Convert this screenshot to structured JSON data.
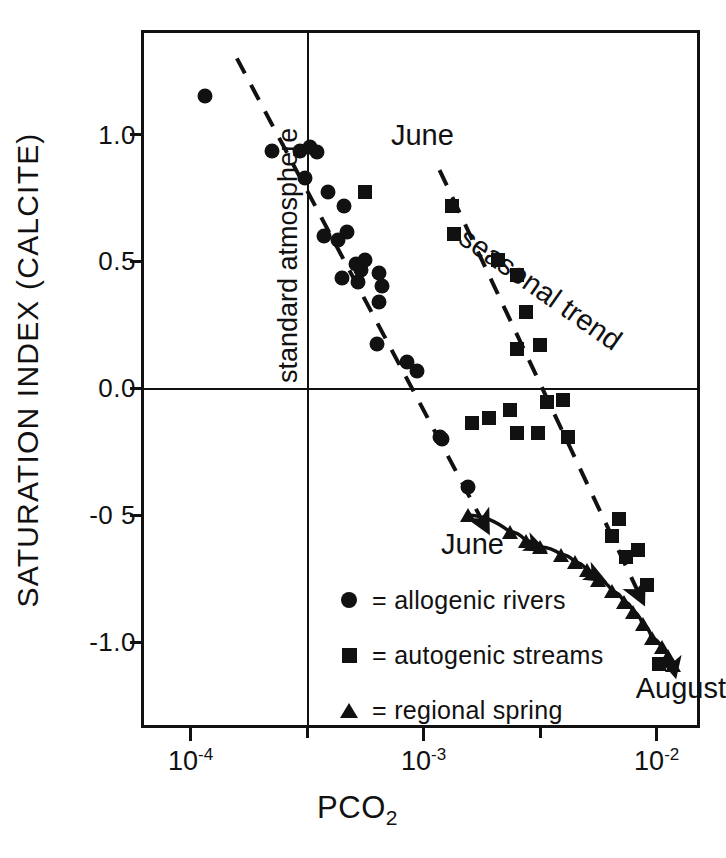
{
  "figure": {
    "background_color": "#ffffff",
    "ink_color": "#111111"
  },
  "axes": {
    "y_title": "SATURATION INDEX (CALCITE)",
    "x_title_main": "PCO",
    "x_title_sub": "2",
    "y_ticks": [
      {
        "value": 1.0,
        "label": "1.0"
      },
      {
        "value": 0.5,
        "label": "0.5"
      },
      {
        "value": 0.0,
        "label": "0.0"
      },
      {
        "value": -0.5,
        "label": "-0 5"
      },
      {
        "value": -1.0,
        "label": "-1.0"
      }
    ],
    "x_ticks": [
      {
        "value": 0.0001,
        "mantissa": "10",
        "exponent": "-4",
        "major": true
      },
      {
        "value": 0.000316,
        "mantissa": "",
        "exponent": "",
        "major": false
      },
      {
        "value": 0.001,
        "mantissa": "10",
        "exponent": "-3",
        "major": true
      },
      {
        "value": 0.00316,
        "mantissa": "",
        "exponent": "",
        "major": false
      },
      {
        "value": 0.01,
        "mantissa": "10",
        "exponent": "-2",
        "major": true
      }
    ]
  },
  "annotations": {
    "june_upper": "June",
    "seasonal_trend": "seasonal trend",
    "june_lower": "June",
    "august": "August",
    "standard_atmosphere": "standard  atmosphere"
  },
  "legend": {
    "items": [
      {
        "symbol": "circle",
        "label": "= allogenic  rivers"
      },
      {
        "symbol": "square",
        "label": "= autogenic  streams"
      },
      {
        "symbol": "triangle",
        "label": "= regional  spring"
      }
    ]
  },
  "chart_data": {
    "type": "scatter",
    "title": "",
    "xlabel": "PCO2",
    "ylabel": "SATURATION INDEX (CALCITE)",
    "x_scale": "log",
    "xlim": [
      6.31e-05,
      0.0158
    ],
    "ylim": [
      -1.35,
      1.4
    ],
    "grid": false,
    "legend_position": "inside-lower-left",
    "reference_lines": [
      {
        "name": "standard atmosphere",
        "orientation": "vertical",
        "x": 0.000316,
        "style": "solid",
        "label": "standard  atmosphere"
      },
      {
        "name": "zero saturation",
        "orientation": "horizontal",
        "y": 0.0,
        "style": "solid",
        "label": ""
      }
    ],
    "trend_lines": [
      {
        "name": "allogenic rivers seasonal trend",
        "style": "dashed",
        "arrow_end": true,
        "start": {
          "x": 0.000158,
          "y": 1.3
        },
        "end": {
          "x": 0.00178,
          "y": -0.52
        },
        "label": "June"
      },
      {
        "name": "autogenic streams seasonal trend",
        "style": "dashed",
        "arrow_end": true,
        "start": {
          "x": 0.00117,
          "y": 0.86
        },
        "end": {
          "x": 0.0083,
          "y": -0.8
        },
        "label": "seasonal trend"
      },
      {
        "name": "regional spring trend",
        "style": "solid",
        "arrow_end": true,
        "start": {
          "x": 0.00155,
          "y": -0.5
        },
        "end": {
          "x": 0.0104,
          "y": -1.05
        },
        "label": "June → August"
      }
    ],
    "series": [
      {
        "name": "allogenic rivers",
        "symbol": "circle",
        "points": [
          {
            "x": 0.000115,
            "y": 1.15
          },
          {
            "x": 0.000224,
            "y": 0.935
          },
          {
            "x": 0.000295,
            "y": 0.935
          },
          {
            "x": 0.000324,
            "y": 0.95
          },
          {
            "x": 0.000347,
            "y": 0.93
          },
          {
            "x": 0.000309,
            "y": 0.83
          },
          {
            "x": 0.000389,
            "y": 0.775
          },
          {
            "x": 0.000372,
            "y": 0.6
          },
          {
            "x": 0.000427,
            "y": 0.585
          },
          {
            "x": 0.000457,
            "y": 0.72
          },
          {
            "x": 0.000468,
            "y": 0.615
          },
          {
            "x": 0.000447,
            "y": 0.435
          },
          {
            "x": 0.000513,
            "y": 0.49
          },
          {
            "x": 0.000525,
            "y": 0.42
          },
          {
            "x": 0.000537,
            "y": 0.465
          },
          {
            "x": 0.000562,
            "y": 0.505
          },
          {
            "x": 0.000646,
            "y": 0.455
          },
          {
            "x": 0.000661,
            "y": 0.405
          },
          {
            "x": 0.000646,
            "y": 0.34
          },
          {
            "x": 0.000631,
            "y": 0.175
          },
          {
            "x": 0.000851,
            "y": 0.105
          },
          {
            "x": 0.000933,
            "y": 0.07
          },
          {
            "x": 0.00118,
            "y": -0.19
          },
          {
            "x": 0.0012,
            "y": -0.2
          },
          {
            "x": 0.00155,
            "y": -0.39
          }
        ]
      },
      {
        "name": "autogenic streams",
        "symbol": "square",
        "points": [
          {
            "x": 0.000562,
            "y": 0.775
          },
          {
            "x": 0.00132,
            "y": 0.72
          },
          {
            "x": 0.00135,
            "y": 0.61
          },
          {
            "x": 0.00209,
            "y": 0.505
          },
          {
            "x": 0.00251,
            "y": 0.445
          },
          {
            "x": 0.00275,
            "y": 0.3
          },
          {
            "x": 0.00251,
            "y": 0.155
          },
          {
            "x": 0.00316,
            "y": 0.17
          },
          {
            "x": 0.00162,
            "y": -0.135
          },
          {
            "x": 0.00191,
            "y": -0.115
          },
          {
            "x": 0.00234,
            "y": -0.085
          },
          {
            "x": 0.00251,
            "y": -0.175
          },
          {
            "x": 0.00309,
            "y": -0.175
          },
          {
            "x": 0.00339,
            "y": -0.055
          },
          {
            "x": 0.00398,
            "y": -0.045
          },
          {
            "x": 0.00417,
            "y": -0.19
          },
          {
            "x": 0.00646,
            "y": -0.58
          },
          {
            "x": 0.00692,
            "y": -0.515
          },
          {
            "x": 0.00741,
            "y": -0.665
          },
          {
            "x": 0.00832,
            "y": -0.635
          },
          {
            "x": 0.00912,
            "y": -0.775
          },
          {
            "x": 0.0102,
            "y": -1.085
          }
        ]
      },
      {
        "name": "regional spring",
        "symbol": "triangle",
        "points": [
          {
            "x": 0.00155,
            "y": -0.5
          },
          {
            "x": 0.00234,
            "y": -0.565
          },
          {
            "x": 0.00275,
            "y": -0.6
          },
          {
            "x": 0.00316,
            "y": -0.625
          },
          {
            "x": 0.00389,
            "y": -0.655
          },
          {
            "x": 0.00447,
            "y": -0.685
          },
          {
            "x": 0.00501,
            "y": -0.715
          },
          {
            "x": 0.00562,
            "y": -0.755
          },
          {
            "x": 0.00646,
            "y": -0.8
          },
          {
            "x": 0.00724,
            "y": -0.84
          },
          {
            "x": 0.00794,
            "y": -0.88
          },
          {
            "x": 0.00871,
            "y": -0.93
          },
          {
            "x": 0.00955,
            "y": -0.985
          },
          {
            "x": 0.0105,
            "y": -1.02
          },
          {
            "x": 0.0112,
            "y": -1.055
          },
          {
            "x": 0.0117,
            "y": -1.09
          }
        ]
      }
    ]
  },
  "bottom_caption": ""
}
